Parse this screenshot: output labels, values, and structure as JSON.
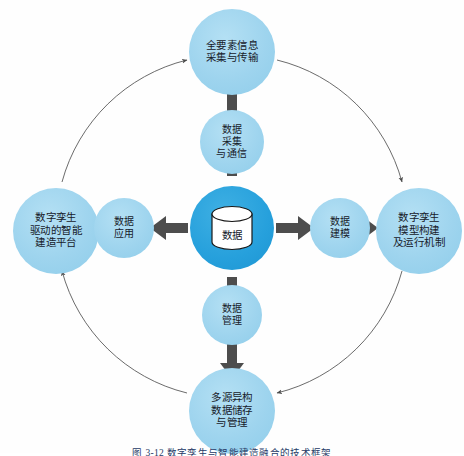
{
  "figure": {
    "type": "cycle-diagram",
    "caption": "图 3-12  数字孪生与智能建造融合的技术框架",
    "background_color": "#fefefe",
    "ring_color": "#5a5a5a",
    "arrow_color": "#4d4d4d",
    "node_color": "#9fd5ef",
    "center_node_color": "#26a0dc"
  },
  "center": {
    "name": "center-node",
    "icon": "database-cylinder-icon",
    "label": "数据"
  },
  "inner_nodes": [
    {
      "id": "data-collection",
      "position": "top",
      "lines": [
        "数据",
        "采集",
        "与通信"
      ]
    },
    {
      "id": "data-modeling",
      "position": "right",
      "lines": [
        "数据",
        "建模"
      ]
    },
    {
      "id": "data-management",
      "position": "bottom",
      "lines": [
        "数据",
        "管理"
      ]
    },
    {
      "id": "data-application",
      "position": "left",
      "lines": [
        "数据",
        "应用"
      ]
    }
  ],
  "outer_nodes": [
    {
      "id": "element-info-acquisition",
      "position": "top",
      "lines": [
        "全要素信息",
        "采集与传输"
      ]
    },
    {
      "id": "twin-model-construction",
      "position": "right",
      "lines": [
        "数字孪生",
        "模型构建",
        "及运行机制"
      ]
    },
    {
      "id": "heterogeneous-data-storage",
      "position": "bottom",
      "lines": [
        "多源异构",
        "数据储存",
        "与管理"
      ]
    },
    {
      "id": "twin-driven-platform",
      "position": "left",
      "lines": [
        "数字孪生",
        "驱动的智能",
        "建造平台"
      ]
    }
  ]
}
